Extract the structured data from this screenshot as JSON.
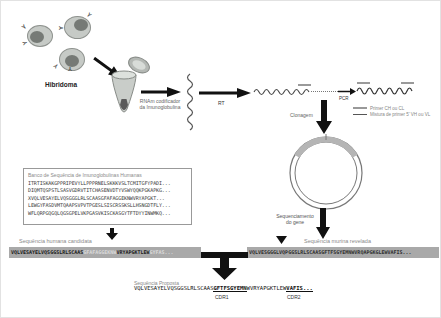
{
  "pipeline": {
    "hibridoma_label": "Hibridoma",
    "tube_label_line1": "RNAm codificador",
    "tube_label_line2": "da Imunoglobulina",
    "rt_label": "RT",
    "pcr_label": "PCR",
    "clonagem_label": "Clonagem",
    "sequencing_label_line1": "Sequenciamento",
    "sequencing_label_line2": "do gene"
  },
  "legend": {
    "items": [
      {
        "label": "Primer CH ou CL"
      },
      {
        "label": "Mistura de primer 5' VH ou VL"
      }
    ]
  },
  "database": {
    "title": "Banco de Sequência de Imunoglobulinas Humanas",
    "lines": [
      "ITRTISKAKGPPRIPEVYLLPPPRNELSKKKVSLTCMITGFYPADI...",
      "DIQMTQSPSTLSASVGDRVTITCHASENVDTYVSWYQQKPGKAPKG...",
      "XVQLVESAYELVQSGGGLRLSCAASGFAFAGGEKNWVRYAPGKT...",
      "LEWGYFASDVMTQAAPSVPVTPGESLSISCRSSKSLLHSNGDTFLY...",
      "WFLQRPGQGQLQGSGPELVKPGASVKISCKASGYTFTDYYINWMKQ..."
    ]
  },
  "human_candidate": {
    "label": "Sequência humana candidata",
    "seg1": "VQLVESAYELVQSGGSLRLSCAAS",
    "seg2": "GFAFAGGEKNW",
    "seg3": "VRYAPGKTLEW",
    "seg4": "GYFAS..."
  },
  "murine_revealed": {
    "label": "Sequência murina revelada",
    "sequence": "VQLVESGGGLVQPGGSLRLSCAASGFTFSGYEMNWVRQAPGKGLEWVAFIS..."
  },
  "proposed": {
    "label": "Sequência Proposta",
    "fw1": "VQLVESAYELVQSGGSLRLSCAAS",
    "cdr1_seq": "GFTFSGYEMN",
    "fw2": "WVRYAPGKTLEW",
    "cdr2_seq": "VAFIS...",
    "cdr1_label": "CDR1",
    "cdr2_label": "CDR2"
  },
  "colors": {
    "bar_bg": "#a9a9a9",
    "arrow": "#111111",
    "muted_text": "#8a8a8a",
    "cell_body": "#c6cac6",
    "cell_nucleus": "#767a76",
    "plasmid_insert": "#b5b5b5"
  }
}
